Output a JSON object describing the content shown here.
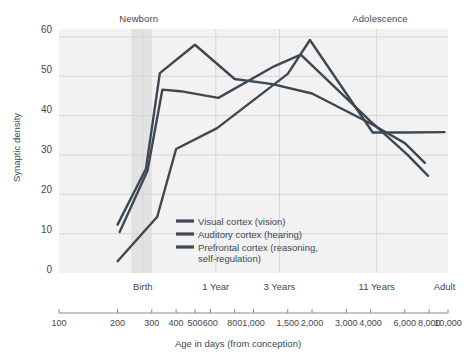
{
  "chart_data": {
    "type": "line",
    "title": "",
    "xlabel": "Age in days (from conception)",
    "ylabel": "Synaptic density",
    "xscale": "log",
    "xlim": [
      100,
      10000
    ],
    "ylim": [
      0,
      62
    ],
    "grid": true,
    "legend_position": "inside-bottom-left",
    "y_ticks": [
      0,
      10,
      20,
      30,
      40,
      50,
      60
    ],
    "x_ticks": [
      100,
      200,
      300,
      400,
      500,
      600,
      800,
      1000,
      1500,
      2000,
      3000,
      4000,
      6000,
      8000,
      10000
    ],
    "x_tick_labels": [
      "100",
      "200",
      "300",
      "400",
      "500",
      "600",
      "800",
      "1,000",
      "1,500",
      "2,000",
      "3,000",
      "4,000",
      "6,000",
      "8,000",
      "10,000"
    ],
    "milestones": [
      {
        "label": "Birth",
        "x": 270
      },
      {
        "label": "1 Year",
        "x": 640
      },
      {
        "label": "3 Years",
        "x": 1360
      },
      {
        "label": "11 Years",
        "x": 4300
      },
      {
        "label": "Adult",
        "x": 9600
      }
    ],
    "eras": [
      {
        "label": "Newborn",
        "x": 265
      },
      {
        "label": "Adolescence",
        "x": 4700
      }
    ],
    "shaded_band": {
      "from": 235,
      "to": 300
    },
    "series": [
      {
        "name": "Visual cortex (vision)",
        "color": "#3d4852",
        "points": [
          [
            200,
            12.3
          ],
          [
            280,
            26.5
          ],
          [
            330,
            50.8
          ],
          [
            500,
            58.0
          ],
          [
            800,
            49.3
          ],
          [
            1250,
            48.0
          ],
          [
            2000,
            45.6
          ],
          [
            4000,
            38.0
          ],
          [
            6000,
            33.0
          ],
          [
            7600,
            28.0
          ]
        ]
      },
      {
        "name": "Auditory cortex (hearing)",
        "color": "#3d4852",
        "points": [
          [
            205,
            10.4
          ],
          [
            285,
            26.0
          ],
          [
            340,
            46.6
          ],
          [
            420,
            46.2
          ],
          [
            660,
            44.5
          ],
          [
            1250,
            52.3
          ],
          [
            1750,
            55.5
          ],
          [
            4000,
            38.5
          ],
          [
            6200,
            30.0
          ],
          [
            7900,
            24.7
          ]
        ]
      },
      {
        "name": "Prefrontal cortex (reasoning, self-regulation)",
        "color": "#3d4852",
        "points": [
          [
            200,
            3.0
          ],
          [
            320,
            14.3
          ],
          [
            400,
            31.5
          ],
          [
            650,
            36.8
          ],
          [
            1500,
            50.6
          ],
          [
            1950,
            59.2
          ],
          [
            4100,
            35.7
          ],
          [
            6000,
            35.7
          ],
          [
            9600,
            35.8
          ]
        ]
      }
    ]
  },
  "axis": {
    "y_title": "Synaptic density",
    "x_title": "Age in days (from conception)"
  },
  "legend": {
    "items": [
      {
        "label": "Visual cortex (vision)"
      },
      {
        "label": "Auditory cortex (hearing)"
      },
      {
        "label": "Prefrontal cortex (reasoning,\nself-regulation)"
      }
    ]
  },
  "colors": {
    "line": "#3d4852",
    "plot_background": "#f2f2f2",
    "grid": "#d6d6d6",
    "band": "#e2e2e2",
    "text": "#3d4852",
    "axis": "#8a8a8a"
  }
}
